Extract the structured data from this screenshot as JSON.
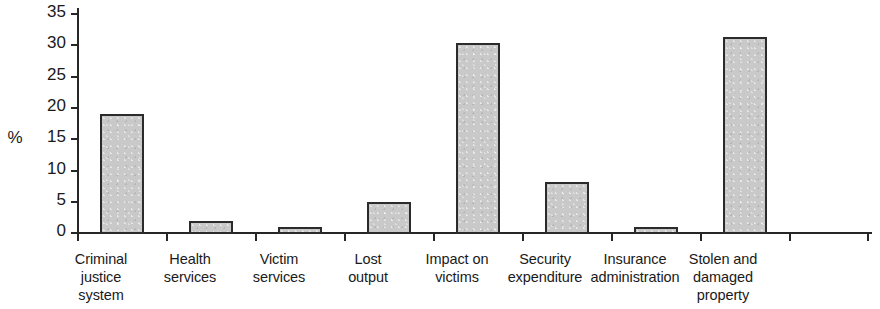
{
  "chart_data": {
    "type": "bar",
    "title": "",
    "subtitle": "",
    "xlabel": "",
    "ylabel": "%",
    "ylim": [
      0,
      35
    ],
    "yticks": [
      0,
      5,
      10,
      15,
      20,
      25,
      30,
      35
    ],
    "ytick_labels": [
      "0",
      "5",
      "10",
      "15",
      "20",
      "25",
      "30",
      "35"
    ],
    "grid": false,
    "legend": false,
    "legend_position": "none",
    "bar_fill_color": "#c9c9c9",
    "bar_border_color": "#2b2b2b",
    "axis_color": "#262626",
    "background_color": "#ffffff",
    "categories": [
      "Criminal\njustice\nsystem",
      "Health\nservices",
      "Victim\nservices",
      "Lost\noutput",
      "Impact on\nvictims",
      "Security\nexpenditure",
      "Insurance\nadministration",
      "Stolen and\ndamaged\nproperty"
    ],
    "values": [
      19.2,
      2.1,
      1.1,
      5.1,
      30.5,
      8.3,
      1.1,
      31.5
    ]
  }
}
